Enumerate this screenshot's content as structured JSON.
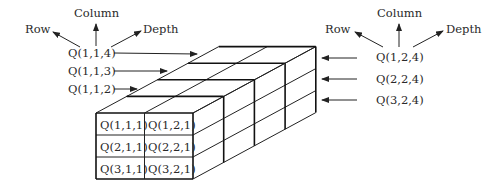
{
  "dimensions": {
    "rows": 3,
    "columns": 2,
    "depth": 4
  },
  "axes_left": {
    "row": "Row",
    "column": "Column",
    "depth": "Depth"
  },
  "axes_right": {
    "row": "Row",
    "column": "Column",
    "depth": "Depth"
  },
  "left_labels": [
    "Q(1,1,4)",
    "Q(1,1,3)",
    "Q(1,1,2)"
  ],
  "right_labels": [
    "Q(1,2,4)",
    "Q(2,2,4)",
    "Q(3,2,4)"
  ],
  "front_cells": [
    [
      "Q(1,1,1)",
      "Q(1,2,1)"
    ],
    [
      "Q(2,1,1)",
      "Q(2,2,1)"
    ],
    [
      "Q(3,1,1)",
      "Q(3,2,1)"
    ]
  ],
  "colors": {
    "line": "#222222",
    "text": "#2a2a2a",
    "background": "#ffffff"
  }
}
